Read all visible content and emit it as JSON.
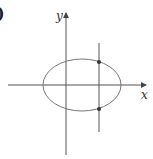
{
  "figure": {
    "part_label": ")",
    "x_axis_label": "x",
    "y_axis_label": "y",
    "shapes": {
      "ellipse": {
        "cx": 82,
        "cy": 85,
        "rx": 39,
        "ry": 26
      },
      "vertical_line": {
        "x": 99,
        "y1": 43,
        "y2": 132
      },
      "intersection_points": [
        {
          "x": 99,
          "y": 62
        },
        {
          "x": 99,
          "y": 109
        }
      ]
    },
    "colors": {
      "axis": "#555555",
      "curve": "#777777",
      "point": "#333333"
    }
  }
}
